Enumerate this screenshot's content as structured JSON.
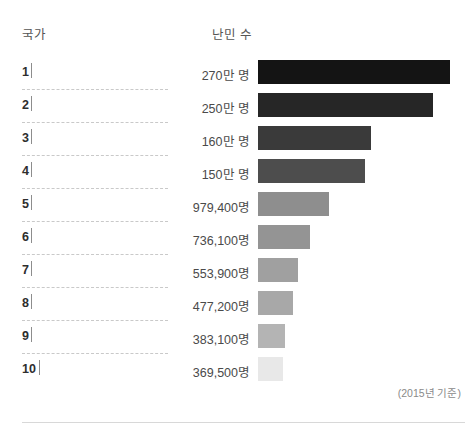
{
  "header": {
    "country_label": "국가",
    "refugees_label": "난민 수"
  },
  "footnote": "(2015년 기준)",
  "rows": [
    {
      "rank": "1",
      "country": "",
      "value_label": "270만 명",
      "value": 2700000,
      "bar_px": 192,
      "color": "#141414"
    },
    {
      "rank": "2",
      "country": "",
      "value_label": "250만 명",
      "value": 2500000,
      "bar_px": 175,
      "color": "#262626"
    },
    {
      "rank": "3",
      "country": "",
      "value_label": "160만 명",
      "value": 1600000,
      "bar_px": 113,
      "color": "#3a3a3a"
    },
    {
      "rank": "4",
      "country": "",
      "value_label": "150만 명",
      "value": 1500000,
      "bar_px": 107,
      "color": "#4d4d4d"
    },
    {
      "rank": "5",
      "country": "",
      "value_label": "979,400명",
      "value": 979400,
      "bar_px": 71,
      "color": "#8e8e8e"
    },
    {
      "rank": "6",
      "country": "",
      "value_label": "736,100명",
      "value": 736100,
      "bar_px": 52,
      "color": "#949494"
    },
    {
      "rank": "7",
      "country": "",
      "value_label": "553,900명",
      "value": 553900,
      "bar_px": 40,
      "color": "#a0a0a0"
    },
    {
      "rank": "8",
      "country": "",
      "value_label": "477,200명",
      "value": 477200,
      "bar_px": 35,
      "color": "#a8a8a8"
    },
    {
      "rank": "9",
      "country": "",
      "value_label": "383,100명",
      "value": 383100,
      "bar_px": 27,
      "color": "#b4b4b4"
    },
    {
      "rank": "10",
      "country": "",
      "value_label": "369,500명",
      "value": 369500,
      "bar_px": 25,
      "color": "#e8e8e8"
    }
  ],
  "chart_data": {
    "type": "bar",
    "title": "",
    "orientation": "horizontal",
    "xlabel": "난민 수",
    "ylabel": "국가",
    "grid": false,
    "legend": null,
    "annotations": [
      "(2015년 기준)"
    ],
    "categories": [
      "1",
      "2",
      "3",
      "4",
      "5",
      "6",
      "7",
      "8",
      "9",
      "10"
    ],
    "category_names": [
      "",
      "",
      "",
      "",
      "",
      "",
      "",
      "",
      "",
      ""
    ],
    "values": [
      2700000,
      2500000,
      1600000,
      1500000,
      979400,
      736100,
      553900,
      477200,
      383100,
      369500
    ],
    "value_labels": [
      "270만 명",
      "250만 명",
      "160만 명",
      "150만 명",
      "979,400명",
      "736,100명",
      "553,900명",
      "477,200명",
      "383,100명",
      "369,500명"
    ],
    "bar_colors": [
      "#141414",
      "#262626",
      "#3a3a3a",
      "#4d4d4d",
      "#8e8e8e",
      "#949494",
      "#a0a0a0",
      "#a8a8a8",
      "#b4b4b4",
      "#e8e8e8"
    ],
    "xlim": [
      0,
      2700000
    ]
  }
}
